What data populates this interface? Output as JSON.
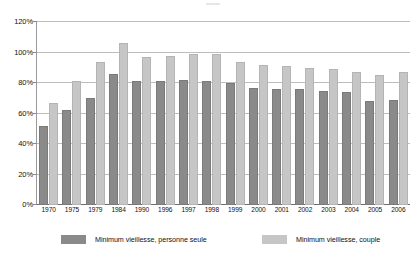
{
  "chart_data": {
    "type": "bar",
    "title": "",
    "xlabel": "",
    "ylabel": "",
    "ylim": [
      0,
      120
    ],
    "ytick_suffix": "%",
    "yticks": [
      0,
      20,
      40,
      60,
      80,
      100,
      120
    ],
    "ytick_labels": [
      "0%",
      "20%",
      "40%",
      "60%",
      "80%",
      "100%",
      "120%"
    ],
    "grid": true,
    "legend_position": "bottom",
    "categories": [
      "1970",
      "1975",
      "1979",
      "1984",
      "1990",
      "1996",
      "1997",
      "1998",
      "1999",
      "2000",
      "2001",
      "2002",
      "2003",
      "2004",
      "2005",
      "2006"
    ],
    "series": [
      {
        "name": "Minimum vieillesse, personne seule",
        "color": "#8a8a8a",
        "values": [
          52,
          62,
          70,
          86,
          81,
          81,
          82,
          81,
          80,
          77,
          76,
          76,
          75,
          74,
          68,
          69
        ]
      },
      {
        "name": "Minimum vieillesse, couple",
        "color": "#c6c6c6",
        "values": [
          67,
          81,
          94,
          106,
          97,
          98,
          99,
          99,
          94,
          92,
          91,
          90,
          89,
          87,
          85,
          87
        ]
      }
    ]
  },
  "legend": {
    "items": [
      {
        "label": "Minimum vieillesse, personne seule",
        "color": "#8a8a8a"
      },
      {
        "label": "Minimum vieillesse, couple",
        "color": "#c6c6c6"
      }
    ]
  },
  "colors": {
    "series_dark": "#8a8a8a",
    "series_light": "#c6c6c6",
    "gridline": "#bdbdbd",
    "axis": "#6e6e6e",
    "text": "#111111",
    "background": "#ffffff"
  }
}
